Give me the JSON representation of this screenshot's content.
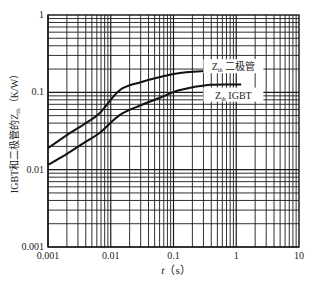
{
  "chart_data": {
    "type": "line",
    "title": "",
    "xlabel": "t (s)",
    "ylabel": "IGBT和二极管的Zth (K/W)",
    "xscale": "log",
    "yscale": "log",
    "xlim": [
      0.001,
      10
    ],
    "ylim": [
      0.001,
      1
    ],
    "grid": true,
    "x_ticks": [
      "0.001",
      "0.01",
      "0.1",
      "1",
      "10"
    ],
    "y_ticks": [
      "0.001",
      "0.01",
      "0.1",
      "1"
    ],
    "series": [
      {
        "name": "Zth 二极管",
        "label_main": "Z",
        "label_sub": "th",
        "label_rest": " 二极管",
        "points": [
          [
            0.001,
            0.019
          ],
          [
            0.002,
            0.028
          ],
          [
            0.004,
            0.04
          ],
          [
            0.0067,
            0.054
          ],
          [
            0.014,
            0.107
          ],
          [
            0.03,
            0.135
          ],
          [
            0.061,
            0.158
          ],
          [
            0.127,
            0.178
          ],
          [
            0.38,
            0.19
          ],
          [
            1.2,
            0.192
          ]
        ]
      },
      {
        "name": "Zth IGBT",
        "label_main": "Z",
        "label_sub": "th",
        "label_rest": " IGBT",
        "points": [
          [
            0.001,
            0.0115
          ],
          [
            0.002,
            0.016
          ],
          [
            0.004,
            0.023
          ],
          [
            0.0067,
            0.03
          ],
          [
            0.014,
            0.051
          ],
          [
            0.03,
            0.068
          ],
          [
            0.061,
            0.085
          ],
          [
            0.127,
            0.107
          ],
          [
            0.38,
            0.125
          ],
          [
            1.2,
            0.126
          ]
        ]
      }
    ],
    "annotations": [
      {
        "text": "Zth 二极管",
        "x": 0.9,
        "y": 0.205
      },
      {
        "text": "Zth IGBT",
        "x": 0.9,
        "y": 0.088
      }
    ]
  },
  "labels": {
    "xlabel_italic": "t",
    "xlabel_unit": "（s）",
    "ylabel_prefix": "IGBT和二极管的Z",
    "ylabel_sub": "th",
    "ylabel_unit": "（K/W）"
  }
}
